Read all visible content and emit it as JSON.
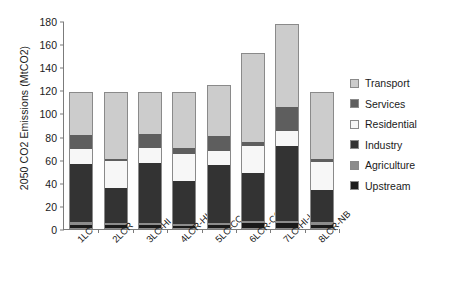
{
  "chart_data": {
    "type": "bar",
    "stacked": true,
    "title": "",
    "xlabel": "",
    "ylabel": "2050 CO2 Emissions (MtCO2)",
    "ylim": [
      0,
      180
    ],
    "ytick_values": [
      0,
      20,
      40,
      60,
      80,
      100,
      120,
      140,
      160,
      180
    ],
    "ytick_labels": [
      "0",
      "20",
      "40",
      "60",
      "80",
      "100",
      "120",
      "140",
      "160",
      "180"
    ],
    "grid": false,
    "legend_position": "right",
    "categories": [
      "1LC",
      "2LCR",
      "3LC-HI",
      "4LCR-HI",
      "5LC-CC",
      "6LCR-CC",
      "7LC-HI-LC",
      "8LCR-NB"
    ],
    "series": [
      {
        "name": "Upstream",
        "color": "#1a1a1a",
        "values": [
          3.0,
          3.0,
          2.5,
          2.0,
          2.5,
          4.0,
          4.0,
          3.0
        ]
      },
      {
        "name": "Agriculture",
        "color": "#8c8c8c",
        "values": [
          2.0,
          1.5,
          2.0,
          1.5,
          2.0,
          2.0,
          2.5,
          2.0
        ]
      },
      {
        "name": "Industry",
        "color": "#333333",
        "values": [
          51.0,
          30.5,
          52.5,
          37.5,
          50.5,
          42.0,
          65.0,
          28.0
        ]
      },
      {
        "name": "Residential",
        "color": "#f7f7f7",
        "values": [
          13.0,
          24.0,
          13.0,
          24.0,
          13.0,
          24.0,
          13.0,
          25.0
        ]
      },
      {
        "name": "Services",
        "color": "#5e5e5e",
        "values": [
          13.0,
          1.5,
          13.0,
          5.0,
          13.0,
          3.0,
          21.0,
          3.0
        ]
      },
      {
        "name": "Transport",
        "color": "#cccccc",
        "values": [
          36.5,
          58.0,
          35.5,
          48.5,
          43.5,
          77.5,
          72.0,
          58.0
        ]
      }
    ],
    "totals": [
      118.5,
      118.5,
      118.5,
      118.5,
      124.5,
      152.5,
      177.5,
      119.0
    ],
    "legend_order": [
      "Transport",
      "Services",
      "Residential",
      "Industry",
      "Agriculture",
      "Upstream"
    ],
    "legend_colors": {
      "Transport": "#cccccc",
      "Services": "#5e5e5e",
      "Residential": "#f7f7f7",
      "Industry": "#333333",
      "Agriculture": "#8c8c8c",
      "Upstream": "#1a1a1a"
    }
  }
}
